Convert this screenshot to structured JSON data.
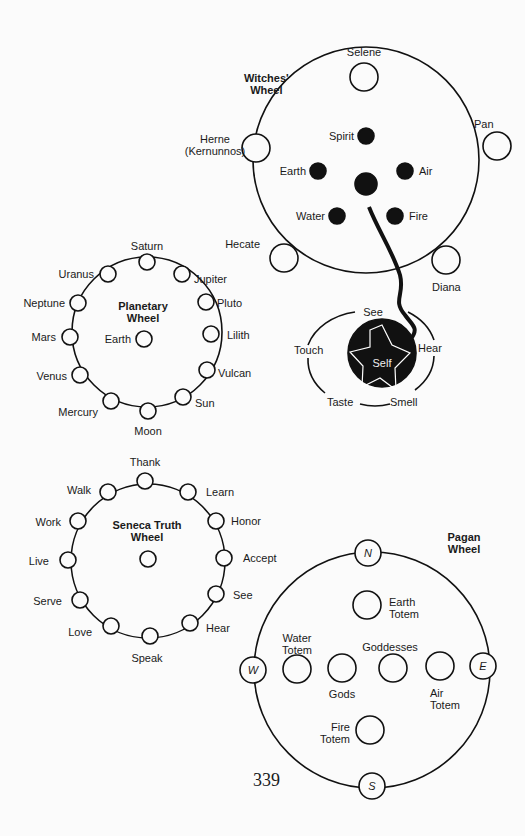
{
  "witches": {
    "title": "Witches'",
    "title2": "Wheel",
    "selene": "Selene",
    "pan": "Pan",
    "herne": "Herne",
    "herne2": "(Kernunnos)",
    "hecate": "Hecate",
    "diana": "Diana",
    "spirit": "Spirit",
    "earth": "Earth",
    "air": "Air",
    "water": "Water",
    "fire": "Fire"
  },
  "self": {
    "center": "Self",
    "see": "See",
    "hear": "Hear",
    "touch": "Touch",
    "taste": "Taste",
    "smell": "Smell"
  },
  "planetary": {
    "title": "Planetary",
    "title2": "Wheel",
    "center": "Earth",
    "nodes": [
      "Saturn",
      "Jupiter",
      "Pluto",
      "Lilith",
      "Vulcan",
      "Sun",
      "Moon",
      "Mercury",
      "Venus",
      "Mars",
      "Neptune",
      "Uranus"
    ]
  },
  "seneca": {
    "title": "Seneca Truth",
    "title2": "Wheel",
    "nodes": [
      "Thank",
      "Learn",
      "Honor",
      "Accept",
      "See",
      "Hear",
      "Speak",
      "Love",
      "Serve",
      "Live",
      "Work",
      "Walk"
    ]
  },
  "pagan": {
    "title": "Pagan",
    "title2": "Wheel",
    "n": "N",
    "s": "S",
    "e": "E",
    "w": "W",
    "earth": "Earth",
    "earth2": "Totem",
    "water": "Water",
    "water2": "Totem",
    "goddesses": "Goddesses",
    "gods": "Gods",
    "air": "Air",
    "air2": "Totem",
    "fire": "Fire",
    "fire2": "Totem"
  },
  "page_number": "339"
}
